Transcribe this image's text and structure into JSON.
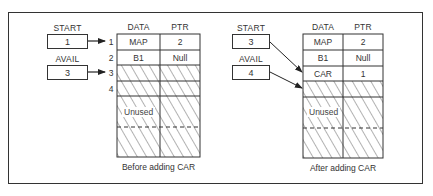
{
  "diagram": {
    "type": "linked-list-array-insertion",
    "panels": [
      {
        "id": "before",
        "caption": "Before adding CAR",
        "pointers": [
          {
            "label": "START",
            "value": "1",
            "points_to_row": 1
          },
          {
            "label": "AVAIL",
            "value": "3",
            "points_to_row": 3
          }
        ],
        "columns": [
          "DATA",
          "PTR"
        ],
        "rows": [
          {
            "index": "1",
            "data": "MAP",
            "ptr": "2",
            "hatched": false
          },
          {
            "index": "2",
            "data": "B1",
            "ptr": "Null",
            "hatched": false
          },
          {
            "index": "3",
            "data": "",
            "ptr": "",
            "hatched": true
          },
          {
            "index": "4",
            "data": "",
            "ptr": "",
            "hatched": true
          }
        ],
        "unused_label": "Unused"
      },
      {
        "id": "after",
        "caption": "After adding CAR",
        "pointers": [
          {
            "label": "START",
            "value": "3",
            "points_to_row": 3
          },
          {
            "label": "AVAIL",
            "value": "4",
            "points_to_row": 4
          }
        ],
        "columns": [
          "DATA",
          "PTR"
        ],
        "rows": [
          {
            "index": "",
            "data": "MAP",
            "ptr": "2",
            "hatched": false
          },
          {
            "index": "",
            "data": "B1",
            "ptr": "Null",
            "hatched": false
          },
          {
            "index": "",
            "data": "CAR",
            "ptr": "1",
            "hatched": false
          },
          {
            "index": "",
            "data": "",
            "ptr": "",
            "hatched": true
          }
        ],
        "unused_label": "Unused"
      }
    ]
  },
  "colors": {
    "line": "#333333",
    "hatch": "#555555",
    "background": "#ffffff"
  }
}
